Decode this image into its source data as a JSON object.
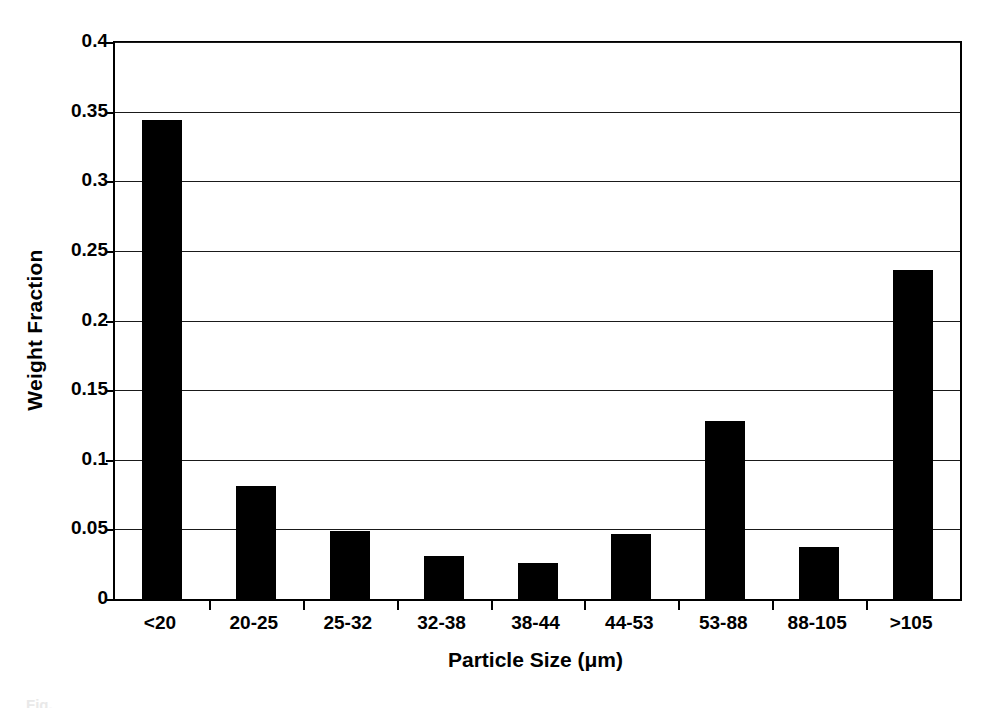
{
  "chart_data": {
    "type": "bar",
    "title": "",
    "xlabel": "Particle Size (μm)",
    "ylabel": "Weight Fraction",
    "categories": [
      "<20",
      "20-25",
      "25-32",
      "32-38",
      "38-44",
      "44-53",
      "53-88",
      "88-105",
      ">105"
    ],
    "values": [
      0.344,
      0.081,
      0.049,
      0.031,
      0.026,
      0.047,
      0.128,
      0.037,
      0.236
    ],
    "series": [
      {
        "name": "Weight Fraction",
        "values": [
          0.344,
          0.081,
          0.049,
          0.031,
          0.026,
          0.047,
          0.128,
          0.037,
          0.236
        ]
      }
    ],
    "ylim": [
      0,
      0.4
    ],
    "ytick_values": [
      0,
      0.05,
      0.1,
      0.15,
      0.2,
      0.25,
      0.3,
      0.35,
      0.4
    ],
    "ytick_labels": [
      "0",
      "0.05",
      "0.1",
      "0.15",
      "0.2",
      "0.25",
      "0.3",
      "0.35",
      "0.4"
    ],
    "grid": "horizontal",
    "legend": "none",
    "bar_color": "#000000",
    "background_color": "#ffffff",
    "axis_color": "#000000"
  },
  "figure": {
    "caption_stub": "Fig."
  }
}
